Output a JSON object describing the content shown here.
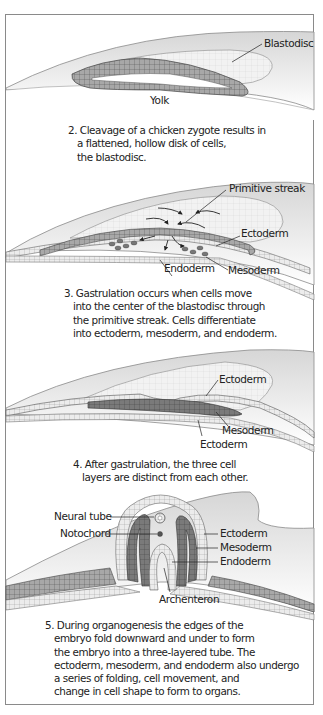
{
  "figure": {
    "panels": [
      {
        "id": "cleavage",
        "labels": {
          "blastodisc": "Blastodisc",
          "yolk": "Yolk"
        },
        "caption": [
          "2. Cleavage of a chicken zygote results in",
          "a flattened, hollow disk of cells,",
          "the blastodisc."
        ]
      },
      {
        "id": "gastrulation",
        "labels": {
          "primitive_streak": "Primitive streak",
          "ectoderm": "Ectoderm",
          "endoderm": "Endoderm",
          "mesoderm": "Mesoderm"
        },
        "caption": [
          "3. Gastrulation occurs when cells move",
          "into the center of the blastodisc through",
          "the primitive streak. Cells differentiate",
          "into ectoderm, mesoderm, and endoderm."
        ]
      },
      {
        "id": "after-gastrulation",
        "labels": {
          "ectoderm_top": "Ectoderm",
          "mesoderm": "Mesoderm",
          "ectoderm_bottom": "Ectoderm"
        },
        "caption": [
          "4. After gastrulation, the three cell",
          "layers are distinct from each other."
        ]
      },
      {
        "id": "organogenesis",
        "labels": {
          "neural_tube": "Neural tube",
          "notochord": "Notochord",
          "ectoderm": "Ectoderm",
          "mesoderm": "Mesoderm",
          "endoderm": "Endoderm",
          "archenteron": "Archenteron"
        },
        "caption": [
          "5. During organogenesis the edges of the",
          "embryo fold downward and under to form",
          "the embryo into a three-layered tube. The",
          "ectoderm, mesoderm, and endoderm also undergo",
          "a series of folding, cell movement, and",
          "change in cell shape to form to organs."
        ]
      }
    ],
    "colors": {
      "yolk": "#e6e6e6",
      "cell_layer": "#9a9a9a",
      "dark_layer": "#6e6e6e",
      "light_layer": "#d4d4d4",
      "outline": "#777777",
      "frame": "#8a8a8a"
    }
  }
}
